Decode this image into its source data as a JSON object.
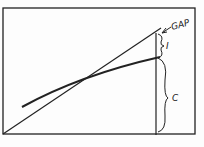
{
  "diagram": {
    "labels": {
      "gap": "GAP",
      "i": "I",
      "c": "C"
    },
    "colors": {
      "ink": "#222222",
      "paper": "#fdfdfd"
    },
    "elements": [
      {
        "name": "frame",
        "type": "rectangle"
      },
      {
        "name": "diagonal-line",
        "type": "straight line from origin"
      },
      {
        "name": "curve-line",
        "type": "concave curve"
      },
      {
        "name": "vertical-line",
        "type": "vertical reference line"
      },
      {
        "name": "brace-i",
        "label": "I"
      },
      {
        "name": "brace-c",
        "label": "C"
      },
      {
        "name": "gap-arrow",
        "label": "GAP"
      }
    ]
  }
}
